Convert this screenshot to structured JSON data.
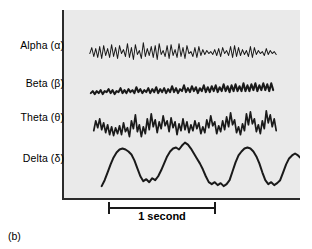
{
  "figure": {
    "caption": "(b)",
    "panel_background": "#eaeaea",
    "axis_color": "#2b2b2b"
  },
  "scalebar": {
    "label": "1 second"
  },
  "labels": {
    "alpha": "Alpha (α)",
    "beta": "Beta (β)",
    "theta": "Theta (θ)",
    "delta": "Delta (δ)"
  },
  "chart_data": {
    "type": "line",
    "title": "",
    "xlabel": "1 second",
    "ylabel": "",
    "grid": false,
    "legend": "left-labels",
    "traces": [
      {
        "name": "Alpha (α)",
        "band": "alpha",
        "stroke": "#1a1a1a",
        "stroke_width": 1.0,
        "baseline_y": 45,
        "amplitude": 9,
        "frequency_hz": 10,
        "points": "26,44 28,38 30,47 32,39 34,48 36,37 38,49 40,36 42,46 44,39 46,48 48,35 50,47 52,38 54,49 56,36 58,44 60,40 62,47 64,34 66,48 68,38 70,50 72,35 74,45 76,41 78,49 80,33 82,47 84,39 86,46 88,37 90,48 92,36 94,50 96,34 98,45 100,41 102,47 104,36 106,49 108,35 110,46 112,40 114,48 116,34 118,47 120,38 122,49 124,36 126,44 128,42 130,47 132,38 134,48 136,37 138,46 140,40 142,45 144,41 146,44 148,42 150,45 152,40 154,46 156,39 158,47 160,38 162,44 164,41 166,46 168,37 170,48 172,36 174,47 176,38 178,46 180,40 182,45 184,41 186,47 188,37 190,48 192,38 194,45 196,41 198,44 200,42 202,46 204,39 206,45 208,41 210,44 212,42 214,45"
      },
      {
        "name": "Beta (β)",
        "band": "beta",
        "stroke": "#1a1a1a",
        "stroke_width": 2.0,
        "baseline_y": 83,
        "amplitude": 4,
        "frequency_hz": 20,
        "points": "27,84 29,82 31,85 33,82 35,84 37,81 39,85 41,82 43,83 45,80 47,84 49,81 51,85 53,82 55,83 57,79 59,84 61,81 63,84 65,80 67,83 69,81 71,84 73,78 75,83 77,80 79,84 81,81 83,83 85,79 87,84 89,80 91,83 93,78 95,84 97,80 99,83 101,79 103,84 105,80 107,83 109,77 111,83 113,79 115,84 117,80 119,82 121,76 123,83 125,79 127,83 129,77 131,82 133,78 135,84 137,79 139,82 141,76 143,83 145,78 147,83 149,77 151,82 153,76 155,83 157,78 159,82 161,75 163,82 165,77 167,83 169,76 171,82 173,75 175,82 177,77 179,82 181,74 183,82 185,76 187,82 189,75 191,81 193,74 195,82 197,76 199,81 201,74 203,81 205,75 207,82 209,74 211,81"
      },
      {
        "name": "Theta (θ)",
        "band": "theta",
        "stroke": "#1a1a1a",
        "stroke_width": 1.7,
        "baseline_y": 118,
        "amplitude": 13,
        "frequency_hz": 6,
        "points": "30,122 32,112 34,119 36,110 38,121 40,114 42,124 44,116 46,126 48,118 50,127 52,119 54,125 56,117 58,126 60,114 62,123 64,119 66,128 68,112 70,120 72,106 74,123 76,116 78,128 80,118 82,125 84,110 86,121 88,105 90,118 92,111 94,124 96,113 98,120 100,107 102,117 104,112 106,123 108,109 110,119 112,113 114,126 116,115 118,122 120,110 122,121 124,113 126,124 128,116 130,122 132,112 134,120 136,114 138,125 140,118 142,124 144,111 146,119 148,107 150,117 152,113 154,125 156,117 158,123 160,112 162,121 164,108 166,118 168,104 170,116 172,111 174,124 176,118 178,126 180,115 182,122 184,105 186,116 188,103 190,115 192,110 194,123 196,116 198,125 200,112 202,120 204,102 206,114 208,106 210,118 212,110 214,122"
      },
      {
        "name": "Delta (δ)",
        "band": "delta",
        "stroke": "#1a1a1a",
        "stroke_width": 2.0,
        "baseline_y": 160,
        "amplitude": 26,
        "frequency_hz": 2,
        "points": "38,178 41,172 44,164 47,156 50,149 53,144 56,141 59,140 62,141 65,143 68,146 71,152 74,160 77,168 80,173 83,171 86,174 89,170 92,172 95,168 98,162 101,155 104,148 107,143 110,140 113,139 116,141 119,137 122,134 125,136 128,140 131,145 134,150 137,155 140,161 143,168 146,174 149,176 152,174 155,177 158,175 161,178 164,176 167,172 170,163 173,154 176,147 179,143 182,140 185,139 188,140 191,143 194,148 197,155 200,164 203,172 206,176 209,174 212,177 215,175 218,172 221,164 224,156 227,150 230,147 233,145 236,147 239,150 242,152 245,156 248,158 251,162 254,166"
      }
    ]
  }
}
